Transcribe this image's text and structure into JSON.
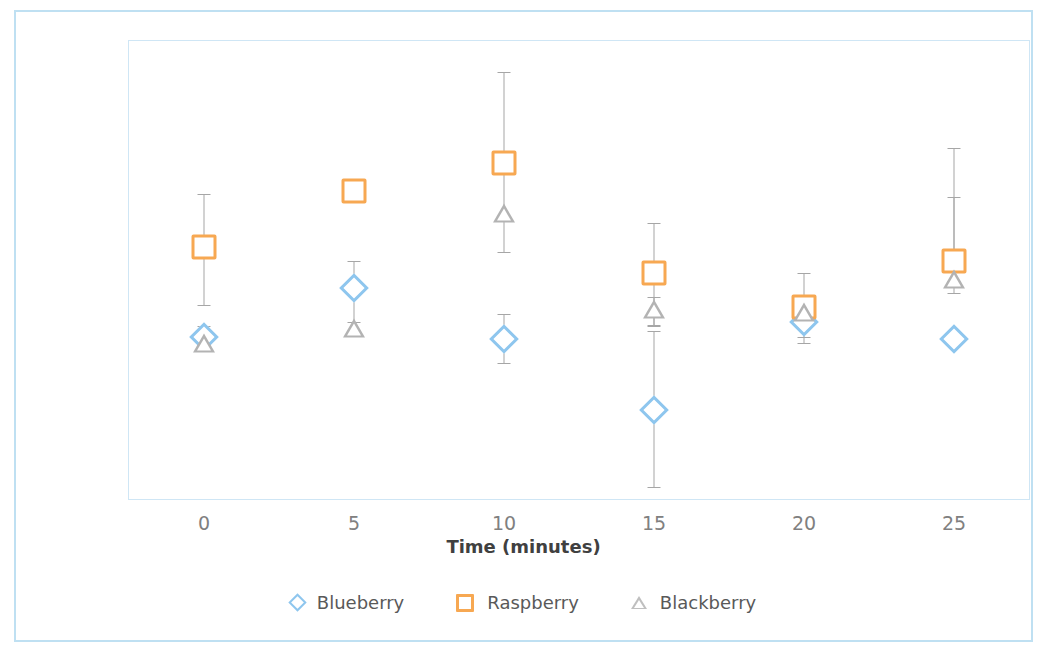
{
  "chart_data": {
    "type": "scatter",
    "title": "",
    "xlabel": "Time (minutes)",
    "ylabel": "L* Color parameter",
    "ylabel_italic_prefix": "L*",
    "ylabel_rest": " Color parameter",
    "x": [
      0,
      5,
      10,
      15,
      20,
      25
    ],
    "xticklabels": [
      "0",
      "5",
      "10",
      "15",
      "20",
      "25"
    ],
    "yticklabels": [
      "58",
      "53",
      "48",
      "43",
      "38",
      "33",
      "28"
    ],
    "yticks": [
      58,
      53,
      48,
      43,
      38,
      33,
      28
    ],
    "xlim": [
      -2.5,
      27.5
    ],
    "ylim": [
      28,
      58
    ],
    "grid": false,
    "legend_position": "bottom",
    "error_bars": true,
    "series": [
      {
        "name": "Blueberry",
        "marker": "diamond",
        "color": "#8ec6ee",
        "values": [
          38.6,
          41.8,
          38.5,
          33.8,
          39.6,
          38.5
        ],
        "err_low": [
          38.6,
          39.6,
          36.9,
          28.8,
          38.2,
          38.5
        ],
        "err_high": [
          38.6,
          43.6,
          40.1,
          39.0,
          41.1,
          38.5
        ]
      },
      {
        "name": "Raspberry",
        "marker": "square",
        "color": "#f7a852",
        "values": [
          44.5,
          48.2,
          50.0,
          42.8,
          40.6,
          43.6
        ],
        "err_low": [
          40.7,
          48.2,
          44.2,
          39.4,
          38.6,
          41.5
        ],
        "err_high": [
          48.0,
          48.2,
          56.0,
          46.1,
          42.8,
          51.0
        ]
      },
      {
        "name": "Blackberry",
        "marker": "triangle",
        "color": "#b3b3b3",
        "values": [
          38.1,
          39.1,
          46.6,
          40.3,
          40.1,
          42.3
        ],
        "err_low": [
          38.1,
          39.1,
          46.6,
          39.3,
          40.1,
          42.3
        ],
        "err_high": [
          39.3,
          39.1,
          46.6,
          41.2,
          40.1,
          47.8
        ]
      }
    ]
  },
  "legend": {
    "items": [
      {
        "label": "Blueberry",
        "marker": "diamond",
        "icon": "diamond-marker-icon"
      },
      {
        "label": "Raspberry",
        "marker": "square",
        "icon": "square-marker-icon"
      },
      {
        "label": "Blackberry",
        "marker": "triangle",
        "icon": "triangle-marker-icon"
      }
    ]
  },
  "colors": {
    "blueberry": "#8ec6ee",
    "raspberry": "#f7a852",
    "blackberry": "#b3b3b3",
    "frame_border": "#bfe0f2",
    "axis_text": "#808080",
    "title_text": "#404040",
    "error_bar": "#a6a6a6"
  }
}
